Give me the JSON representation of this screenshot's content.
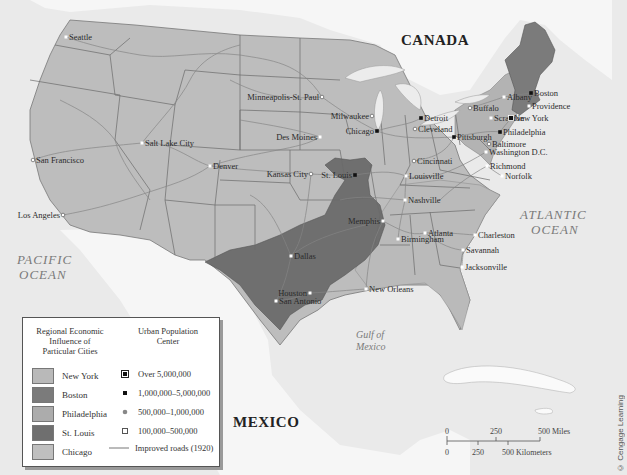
{
  "labels": {
    "countries": [
      "CANADA",
      "MEXICO"
    ],
    "oceans": {
      "atlantic": [
        "ATLANTIC",
        "OCEAN"
      ],
      "pacific": [
        "PACIFIC",
        "OCEAN"
      ],
      "gulf": [
        "Gulf of",
        "Mexico"
      ]
    }
  },
  "cities": [
    {
      "name": "Seattle",
      "x": 66,
      "y": 37,
      "tier": "100k-500k"
    },
    {
      "name": "San Francisco",
      "x": 33,
      "y": 160,
      "tier": "500k-1m"
    },
    {
      "name": "Los Angeles",
      "x": 63,
      "y": 215,
      "tier": "500k-1m"
    },
    {
      "name": "Salt Lake City",
      "x": 142,
      "y": 143,
      "tier": "100k-500k"
    },
    {
      "name": "Denver",
      "x": 210,
      "y": 166,
      "tier": "100k-500k"
    },
    {
      "name": "Minneapolis-St. Paul",
      "x": 322,
      "y": 97,
      "tier": "500k-1m"
    },
    {
      "name": "Milwaukee",
      "x": 372,
      "y": 116,
      "tier": "500k-1m"
    },
    {
      "name": "Des Moines",
      "x": 320,
      "y": 137,
      "tier": "100k-500k"
    },
    {
      "name": "Chicago",
      "x": 377,
      "y": 131,
      "tier": "1m-5m"
    },
    {
      "name": "Kansas City",
      "x": 311,
      "y": 174,
      "tier": "500k-1m"
    },
    {
      "name": "St. Louis",
      "x": 355,
      "y": 175,
      "tier": "1m-5m"
    },
    {
      "name": "Detroit",
      "x": 421,
      "y": 118,
      "tier": "1m-5m"
    },
    {
      "name": "Cleveland",
      "x": 415,
      "y": 129,
      "tier": "500k-1m"
    },
    {
      "name": "Cincinnati",
      "x": 414,
      "y": 161,
      "tier": "500k-1m"
    },
    {
      "name": "Louisville",
      "x": 406,
      "y": 176,
      "tier": "100k-500k"
    },
    {
      "name": "Nashville",
      "x": 405,
      "y": 200,
      "tier": "100k-500k"
    },
    {
      "name": "Memphis",
      "x": 383,
      "y": 221,
      "tier": "100k-500k"
    },
    {
      "name": "Birmingham",
      "x": 398,
      "y": 239,
      "tier": "100k-500k"
    },
    {
      "name": "Atlanta",
      "x": 425,
      "y": 233,
      "tier": "100k-500k"
    },
    {
      "name": "Dallas",
      "x": 291,
      "y": 256,
      "tier": "100k-500k"
    },
    {
      "name": "Houston",
      "x": 310,
      "y": 293,
      "tier": "100k-500k"
    },
    {
      "name": "San Antonio",
      "x": 276,
      "y": 301,
      "tier": "100k-500k"
    },
    {
      "name": "New Orleans",
      "x": 366,
      "y": 289,
      "tier": "100k-500k"
    },
    {
      "name": "Charleston",
      "x": 475,
      "y": 235,
      "tier": "100k-500k"
    },
    {
      "name": "Savannah",
      "x": 463,
      "y": 250,
      "tier": "100k-500k"
    },
    {
      "name": "Jacksonville",
      "x": 462,
      "y": 267,
      "tier": "100k-500k"
    },
    {
      "name": "Albany",
      "x": 504,
      "y": 97,
      "tier": "100k-500k"
    },
    {
      "name": "Buffalo",
      "x": 470,
      "y": 108,
      "tier": "500k-1m"
    },
    {
      "name": "Scranton",
      "x": 491,
      "y": 118,
      "tier": "100k-500k"
    },
    {
      "name": "Pittsburgh",
      "x": 454,
      "y": 137,
      "tier": "1m-5m"
    },
    {
      "name": "Philadelphia",
      "x": 500,
      "y": 132,
      "tier": "1m-5m"
    },
    {
      "name": "New York",
      "x": 511,
      "y": 118,
      "tier": "over-5m"
    },
    {
      "name": "Boston",
      "x": 531,
      "y": 93,
      "tier": "1m-5m"
    },
    {
      "name": "Providence",
      "x": 529,
      "y": 106,
      "tier": "100k-500k"
    },
    {
      "name": "Baltimore",
      "x": 489,
      "y": 144,
      "tier": "500k-1m"
    },
    {
      "name": "Washington D.C.",
      "x": 486,
      "y": 152,
      "tier": "100k-500k"
    },
    {
      "name": "Richmond",
      "x": 487,
      "y": 166,
      "tier": "100k-500k"
    },
    {
      "name": "Norfolk",
      "x": 502,
      "y": 176,
      "tier": "100k-500k"
    }
  ],
  "legend": {
    "regional_title": [
      "Regional Economic",
      "Influence of",
      "Particular Cities"
    ],
    "urban_title": [
      "Urban Population",
      "Center"
    ],
    "regions": [
      {
        "label": "New York",
        "color": "#b9b9b9"
      },
      {
        "label": "Boston",
        "color": "#7b7b7b"
      },
      {
        "label": "Philadelphia",
        "color": "#acacac"
      },
      {
        "label": "St. Louis",
        "color": "#6f6f6f"
      },
      {
        "label": "Chicago",
        "color": "#bfbfbf"
      }
    ],
    "population": [
      {
        "label": "Over 5,000,000",
        "symbol": "square-filled-framed"
      },
      {
        "label": "1,000,000–5,000,000",
        "symbol": "square-black"
      },
      {
        "label": "500,000–1,000,000",
        "symbol": "dot-gray"
      },
      {
        "label": "100,000–500,000",
        "symbol": "square-white"
      },
      {
        "label": "Improved roads (1920)",
        "symbol": "line"
      }
    ]
  },
  "scale": {
    "miles": [
      "0",
      "250",
      "500 Miles"
    ],
    "km": [
      "0",
      "250",
      "500 Kilometers"
    ]
  },
  "credit": "© Cengage Learning",
  "colors": {
    "ocean": "#ececec",
    "land_foreign": "#f7f7f7",
    "chicago_region": "#bdbdbd",
    "new_york_region": "#b8b8b8",
    "philadelphia_region": "#adadad",
    "boston_region": "#7b7b7b",
    "st_louis_region": "#6f6f6f",
    "roads": "#7f7f7f",
    "borders": "#666666"
  }
}
